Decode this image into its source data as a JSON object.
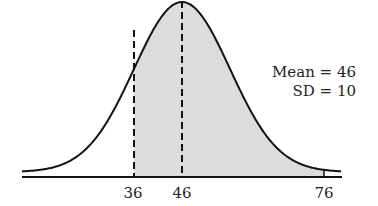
{
  "chart_data": {
    "type": "area",
    "title": "",
    "distribution": "normal",
    "mean": 46,
    "sd": 10,
    "shaded_range": [
      36,
      76
    ],
    "dashed_lines": [
      36,
      46
    ],
    "tick_labels": [
      "36",
      "46",
      "76"
    ],
    "ticks": [
      36,
      46,
      76
    ],
    "annotations": [
      "Mean = 46",
      "SD = 10"
    ],
    "xlabel": "",
    "ylabel": "",
    "grid": false,
    "colors": {
      "shade": "#d9d9d9",
      "line": "#111111"
    }
  },
  "labels": {
    "tick_36": "36",
    "tick_46": "46",
    "tick_76": "76",
    "mean": "Mean = 46",
    "sd": "SD = 10"
  }
}
